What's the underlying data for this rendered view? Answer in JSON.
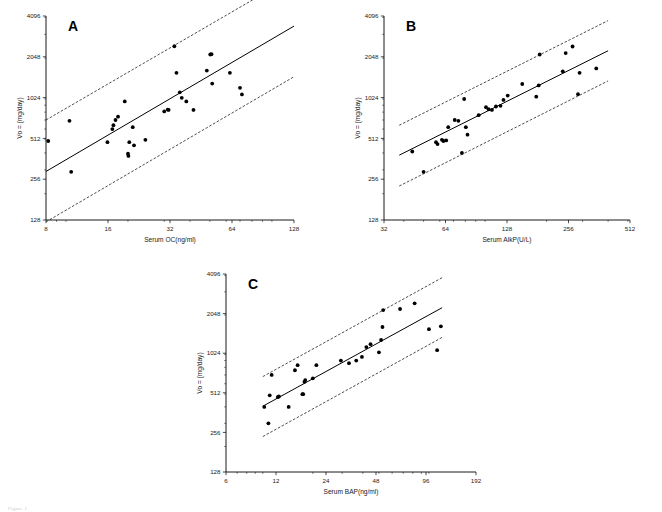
{
  "figure": {
    "caption": "Figure 1",
    "background": "#ffffff",
    "point_color": "#000000",
    "line_color": "#000000"
  },
  "chart_data": [
    {
      "type": "scatter",
      "panel_label": "A",
      "title": "",
      "xlabel": "Serum OC(ng/ml)",
      "ylabel": "Vo = (mg/day)",
      "xscale": "log2",
      "yscale": "log2",
      "xlim": [
        8,
        128
      ],
      "ylim": [
        128,
        4096
      ],
      "xticks": [
        8,
        16,
        32,
        64,
        128
      ],
      "xticklabels": [
        "8",
        "16",
        "32",
        "64",
        "128"
      ],
      "yticks": [
        128,
        256,
        512,
        1024,
        2048,
        4096
      ],
      "yticklabels": [
        "128",
        "256",
        "512",
        "1024",
        "2048",
        "4096"
      ],
      "grid": false,
      "legend": "none",
      "points": [
        [
          8.2,
          490
        ],
        [
          10.4,
          690
        ],
        [
          10.6,
          290
        ],
        [
          15.9,
          480
        ],
        [
          16.8,
          600
        ],
        [
          17.0,
          640
        ],
        [
          17.4,
          700
        ],
        [
          17.9,
          740
        ],
        [
          19.3,
          960
        ],
        [
          20.0,
          395
        ],
        [
          20.1,
          380
        ],
        [
          20.3,
          480
        ],
        [
          21.1,
          620
        ],
        [
          21.4,
          455
        ],
        [
          24.3,
          500
        ],
        [
          30.0,
          810
        ],
        [
          31.2,
          835
        ],
        [
          31.5,
          830
        ],
        [
          33.6,
          2450
        ],
        [
          34.4,
          1560
        ],
        [
          35.7,
          1120
        ],
        [
          36.5,
          1020
        ],
        [
          38.4,
          960
        ],
        [
          41.6,
          830
        ],
        [
          48.3,
          1620
        ],
        [
          50.2,
          2130
        ],
        [
          50.9,
          2140
        ],
        [
          51.3,
          1300
        ],
        [
          62.5,
          1560
        ],
        [
          70.0,
          1210
        ],
        [
          71.5,
          1080
        ]
      ],
      "fit_line": {
        "x": [
          8,
          128
        ],
        "y": [
          292,
          3450
        ]
      },
      "ci_upper": {
        "x": [
          8,
          128
        ],
        "y": [
          700,
          8100
        ]
      },
      "ci_lower": {
        "x": [
          8,
          128
        ],
        "y": [
          124,
          1460
        ]
      }
    },
    {
      "type": "scatter",
      "panel_label": "B",
      "title": "",
      "xlabel": "Serum AlkP(U/L)",
      "ylabel": "Vo = (mg/day)",
      "xscale": "log2",
      "yscale": "log2",
      "xlim": [
        32,
        512
      ],
      "ylim": [
        128,
        4096
      ],
      "xticks": [
        32,
        64,
        128,
        256,
        512
      ],
      "xticklabels": [
        "32",
        "64",
        "128",
        "256",
        "512"
      ],
      "yticks": [
        128,
        256,
        512,
        1024,
        2048,
        4096
      ],
      "yticklabels": [
        "128",
        "256",
        "512",
        "1024",
        "2048",
        "4096"
      ],
      "grid": false,
      "legend": "none",
      "points": [
        [
          44.0,
          410
        ],
        [
          50.0,
          290
        ],
        [
          57.5,
          480
        ],
        [
          58.5,
          465
        ],
        [
          61.5,
          500
        ],
        [
          62.5,
          490
        ],
        [
          64.5,
          495
        ],
        [
          66.0,
          620
        ],
        [
          71.0,
          700
        ],
        [
          74.0,
          690
        ],
        [
          77.0,
          400
        ],
        [
          79.0,
          1000
        ],
        [
          80.5,
          620
        ],
        [
          82.0,
          545
        ],
        [
          93.0,
          760
        ],
        [
          101.0,
          870
        ],
        [
          104.0,
          840
        ],
        [
          108.0,
          830
        ],
        [
          113.0,
          880
        ],
        [
          119.0,
          890
        ],
        [
          123.0,
          985
        ],
        [
          129.0,
          1060
        ],
        [
          152.0,
          1290
        ],
        [
          178.0,
          1040
        ],
        [
          183.0,
          1260
        ],
        [
          185.0,
          2130
        ],
        [
          240.0,
          1600
        ],
        [
          248.0,
          2180
        ],
        [
          268.0,
          2440
        ],
        [
          285.0,
          1085
        ],
        [
          290.0,
          1560
        ],
        [
          350.0,
          1680
        ]
      ],
      "fit_line": {
        "x": [
          38,
          400
        ],
        "y": [
          385,
          2270
        ]
      },
      "ci_upper": {
        "x": [
          38,
          400
        ],
        "y": [
          640,
          3790
        ]
      },
      "ci_lower": {
        "x": [
          38,
          400
        ],
        "y": [
          228,
          1360
        ]
      }
    },
    {
      "type": "scatter",
      "panel_label": "C",
      "title": "",
      "xlabel": "Serum BAP(ng/ml)",
      "ylabel": "Vo = (mg/day)",
      "xscale": "log2",
      "yscale": "log2",
      "xlim": [
        6,
        192
      ],
      "ylim": [
        128,
        4096
      ],
      "xticks": [
        6,
        12,
        24,
        48,
        96,
        192
      ],
      "xticklabels": [
        "6",
        "12",
        "24",
        "48",
        "96",
        "192"
      ],
      "yticks": [
        128,
        256,
        512,
        1024,
        2048,
        4096
      ],
      "yticklabels": [
        "128",
        "256",
        "512",
        "1024",
        "2048",
        "4096"
      ],
      "grid": false,
      "legend": "none",
      "points": [
        [
          10.2,
          400
        ],
        [
          10.8,
          300
        ],
        [
          11.0,
          490
        ],
        [
          11.3,
          700
        ],
        [
          12.3,
          475
        ],
        [
          12.5,
          480
        ],
        [
          14.3,
          400
        ],
        [
          15.6,
          760
        ],
        [
          16.2,
          830
        ],
        [
          17.3,
          500
        ],
        [
          17.5,
          500
        ],
        [
          17.8,
          620
        ],
        [
          18.0,
          640
        ],
        [
          20.0,
          660
        ],
        [
          21.0,
          830
        ],
        [
          29.5,
          900
        ],
        [
          33.0,
          860
        ],
        [
          36.5,
          900
        ],
        [
          39.5,
          960
        ],
        [
          42.0,
          1140
        ],
        [
          44.5,
          1200
        ],
        [
          50.0,
          1040
        ],
        [
          51.5,
          1290
        ],
        [
          52.5,
          1620
        ],
        [
          53.0,
          2180
        ],
        [
          67.0,
          2220
        ],
        [
          82.0,
          2450
        ],
        [
          100.0,
          1560
        ],
        [
          112.0,
          1080
        ],
        [
          118.0,
          1640
        ]
      ],
      "fit_line": {
        "x": [
          10,
          120
        ],
        "y": [
          405,
          2270
        ]
      },
      "ci_upper": {
        "x": [
          10,
          120
        ],
        "y": [
          680,
          3840
        ]
      },
      "ci_lower": {
        "x": [
          10,
          120
        ],
        "y": [
          238,
          1350
        ]
      }
    }
  ]
}
